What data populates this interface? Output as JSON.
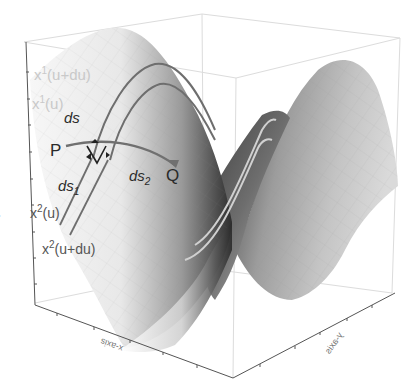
{
  "figure": {
    "type": "3d-surface-diagram",
    "axes": {
      "x_label": "x-axis",
      "y_label": "y-axis",
      "z_label": "z-axis"
    },
    "curve_labels": {
      "x1_u_du_base": "x",
      "x1_u_du_sup": "1",
      "x1_u_du_arg": "(u+du)",
      "x1_u_base": "x",
      "x1_u_sup": "1",
      "x1_u_arg": "(u)",
      "x2_u_base": "x",
      "x2_u_sup": "2",
      "x2_u_arg": "(u)",
      "x2_u_du_base": "x",
      "x2_u_du_sup": "2",
      "x2_u_du_arg": "(u+du)"
    },
    "points": {
      "P": "P",
      "Q": "Q"
    },
    "segments": {
      "ds": "ds",
      "ds1_base": "ds",
      "ds1_sub": "1",
      "ds2_base": "ds",
      "ds2_sub": "2"
    },
    "colors": {
      "curve_dark": "#6e6e6e",
      "curve_light": "#c8c8c8",
      "text_faint": "#c9c9c9",
      "text_dark": "#2a2a2a",
      "box_line": "#d8d8d8",
      "axis_line": "#555555"
    }
  }
}
